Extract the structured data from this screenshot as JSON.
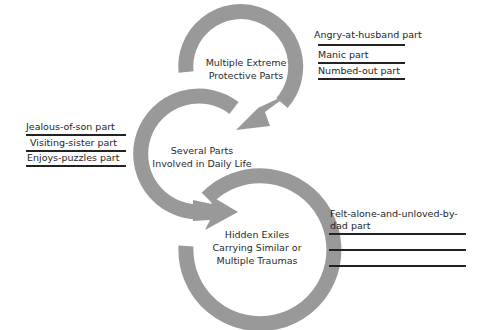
{
  "colors": {
    "arc": "#999999",
    "text": "#222222",
    "background": "#ffffff"
  },
  "groups": {
    "protectors": {
      "title_line1": "Multiple Extreme",
      "title_line2": "Protective Parts",
      "parts": [
        "Angry-at-husband part",
        "Manic part",
        "Numbed-out part"
      ]
    },
    "daily_life": {
      "title_line1": "Several Parts",
      "title_line2": "Involved in Daily Life",
      "parts": [
        "Jealous-of-son part",
        "Visiting-sister part",
        "Enjoys-puzzles part"
      ]
    },
    "exiles": {
      "title_line1": "Hidden Exiles",
      "title_line2": "Carrying Similar or",
      "title_line3": "Multiple Traumas",
      "parts_line1": "Felt-alone-and-unloved-by-",
      "parts_line2": "dad part",
      "blank_lines": 2
    }
  }
}
